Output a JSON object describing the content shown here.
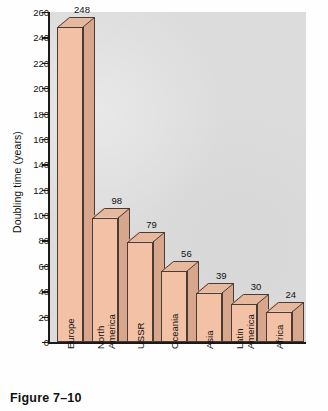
{
  "figure": {
    "caption": "Figure 7–10"
  },
  "chart_data": {
    "type": "bar",
    "title": "",
    "xlabel": "",
    "ylabel": "Doubling time (years)",
    "categories": [
      "Europe",
      "North America",
      "USSR",
      "Oceania",
      "Asia",
      "Latin America",
      "Africa"
    ],
    "category_lines": [
      [
        "Europe"
      ],
      [
        "North",
        "America"
      ],
      [
        "USSR"
      ],
      [
        "Oceania"
      ],
      [
        "Asia"
      ],
      [
        "Latin",
        "America"
      ],
      [
        "Africa"
      ]
    ],
    "values": [
      248,
      98,
      79,
      56,
      39,
      30,
      24
    ],
    "value_labels": [
      "248",
      "98",
      "79",
      "56",
      "39",
      "30",
      "24"
    ],
    "ylim": [
      0,
      260
    ],
    "ytick_values": [
      0,
      20,
      40,
      60,
      80,
      100,
      120,
      140,
      160,
      180,
      200,
      220,
      240,
      260
    ],
    "ytick_labels": [
      "0",
      "20",
      "40",
      "60",
      "80",
      "100",
      "120",
      "140",
      "160",
      "180",
      "200",
      "220",
      "240",
      "260"
    ],
    "grid": false,
    "legend": null,
    "style": "3d-column",
    "colors": {
      "bar_front": "#f3c2a6",
      "bar_side": "#d7a68d",
      "bar_top": "#e6b99e",
      "bar_outline": "#4a3b33",
      "plot_background": "#dcdcdc",
      "axis": "#1a1a1a",
      "text": "#111111",
      "page_background": "#fefefe"
    }
  }
}
